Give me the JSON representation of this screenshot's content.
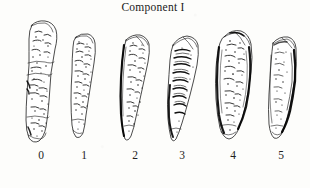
{
  "figure": {
    "title": "Component I",
    "background_color": "#fdfdfb",
    "ink_color": "#1a1a1a",
    "caption_font_style": "serif",
    "width": 310,
    "height": 188,
    "illustration_style": "pen-and-ink line drawing with stipple and hatch shading"
  },
  "specimens": [
    {
      "label": "0",
      "name": "specimen-stage-0",
      "description": "Tall narrow elongate symphyseal face, billowing ridges across upper two thirds, heavy stipple porosity, no rim formation",
      "x": 18,
      "y": 19,
      "width": 46,
      "height": 126,
      "rim": "none",
      "rim_side": "none",
      "texture": "billowed-stippled"
    },
    {
      "label": "1",
      "name": "specimen-stage-1",
      "description": "Narrow tapering face, dense fine stippling, faint ventral bevel, rim absent",
      "x": 64,
      "y": 32,
      "width": 38,
      "height": 111,
      "rim": "none",
      "rim_side": "none",
      "texture": "stippled"
    },
    {
      "label": "2",
      "name": "specimen-stage-2",
      "description": "Wedge-shaped face with dark shaded dorsal margin, partial rim beginning on left edge, scattered stipple",
      "x": 112,
      "y": 32,
      "width": 40,
      "height": 113,
      "rim": "partial",
      "rim_side": "left",
      "texture": "stippled-shaded"
    },
    {
      "label": "3",
      "name": "specimen-stage-3",
      "description": "Broad upper face with strong transverse billowing ridges, shaded lower-left margin, tapering inferior apex",
      "x": 158,
      "y": 33,
      "width": 44,
      "height": 112,
      "rim": "partial",
      "rim_side": "left",
      "texture": "ridged"
    },
    {
      "label": "4",
      "name": "specimen-stage-4",
      "description": "Broad ovoid face with complete dark rim on both margins, flattened surface, coarse stipple",
      "x": 206,
      "y": 27,
      "width": 48,
      "height": 119,
      "rim": "complete",
      "rim_side": "both",
      "texture": "stippled-flat"
    },
    {
      "label": "5",
      "name": "specimen-stage-5",
      "description": "Narrow elongate face with heavy dark rim along right margin, depressed central surface, light stipple",
      "x": 258,
      "y": 33,
      "width": 42,
      "height": 112,
      "rim": "complete",
      "rim_side": "right",
      "texture": "depressed-rimmed"
    }
  ]
}
